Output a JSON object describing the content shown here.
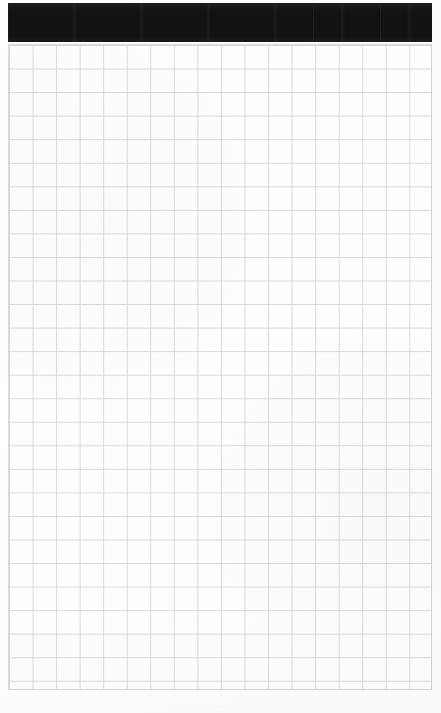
{
  "document": {
    "kind": "scanned-page",
    "page_background_color": "#fdfdfd",
    "width_px": 441,
    "height_px": 713
  },
  "redaction": {
    "label": "",
    "color": "#121212",
    "left_px": 8,
    "top_px": 3,
    "width_px": 424,
    "height_px": 39,
    "seam_offsets_px": [
      305,
      372
    ]
  },
  "grid": {
    "line_color": "#d7d9dc",
    "cell_size_px": 23.55,
    "columns": 18,
    "rows": 27,
    "left_px": 8,
    "top_px": 44,
    "width_px": 424,
    "height_px": 646
  },
  "footer": {
    "mark": "··"
  }
}
